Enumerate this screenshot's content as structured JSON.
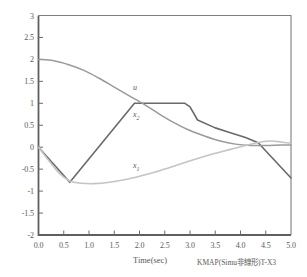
{
  "chart_data": {
    "type": "line",
    "title": "",
    "xlabel": "Time(sec)",
    "ylabel": "",
    "xlim": [
      0.0,
      5.0
    ],
    "ylim": [
      -2,
      3
    ],
    "grid": false,
    "legend_position": "inline-annotations",
    "xticks": [
      "0.0",
      "0.5",
      "1.0",
      "1.5",
      "2.0",
      "2.5",
      "3.0",
      "3.5",
      "4.0",
      "4.5",
      "5.0"
    ],
    "xtick_values": [
      0.0,
      0.5,
      1.0,
      1.5,
      2.0,
      2.5,
      3.0,
      3.5,
      4.0,
      4.5,
      5.0
    ],
    "yticks": [
      "3",
      "2.5",
      "2",
      "1.5",
      "1",
      "0.5",
      "0",
      "-0.5",
      "-1",
      "-1.5",
      "-2"
    ],
    "ytick_values": [
      3,
      2.5,
      2,
      1.5,
      1,
      0.5,
      0,
      -0.5,
      -1,
      -1.5,
      -2
    ],
    "annotations": [
      {
        "text": "u",
        "x": 1.95,
        "y": 1.33,
        "series": "u"
      },
      {
        "text": "x",
        "sub": "2",
        "x": 1.95,
        "y": 0.72,
        "series": "x2"
      },
      {
        "text": "x",
        "sub": "1",
        "x": 1.95,
        "y": -0.44,
        "series": "x1"
      }
    ],
    "series": [
      {
        "name": "u",
        "color": "#6a6a6a",
        "width": 1.6,
        "x": [
          0.0,
          0.62,
          1.9,
          2.9,
          3.0,
          3.15,
          3.5,
          3.8,
          4.1,
          4.35,
          5.0
        ],
        "values": [
          0.0,
          -0.8,
          1.0,
          1.0,
          0.92,
          0.62,
          0.44,
          0.33,
          0.22,
          0.1,
          -0.7
        ]
      },
      {
        "name": "x2",
        "color": "#9a9a9a",
        "width": 1.5,
        "x": [
          0.0,
          0.3,
          0.6,
          0.9,
          1.2,
          1.5,
          1.8,
          2.1,
          2.4,
          2.7,
          3.0,
          3.3,
          3.6,
          3.9,
          4.2,
          4.5,
          4.8,
          5.0
        ],
        "values": [
          2.0,
          1.97,
          1.88,
          1.75,
          1.57,
          1.37,
          1.17,
          0.97,
          0.75,
          0.55,
          0.38,
          0.25,
          0.14,
          0.07,
          0.04,
          0.04,
          0.05,
          0.05
        ]
      },
      {
        "name": "x1",
        "color": "#c4c4c4",
        "width": 1.6,
        "x": [
          0.0,
          0.2,
          0.4,
          0.62,
          0.85,
          1.1,
          1.4,
          1.7,
          2.0,
          2.3,
          2.6,
          2.9,
          3.2,
          3.5,
          3.8,
          4.1,
          4.4,
          4.6,
          4.8,
          5.0
        ],
        "values": [
          0.0,
          -0.3,
          -0.58,
          -0.77,
          -0.82,
          -0.83,
          -0.8,
          -0.74,
          -0.66,
          -0.57,
          -0.46,
          -0.35,
          -0.24,
          -0.14,
          -0.05,
          0.04,
          0.12,
          0.14,
          0.12,
          0.09
        ]
      }
    ]
  },
  "footer": {
    "note": "KMAP(Simu非線形)T-X3"
  }
}
